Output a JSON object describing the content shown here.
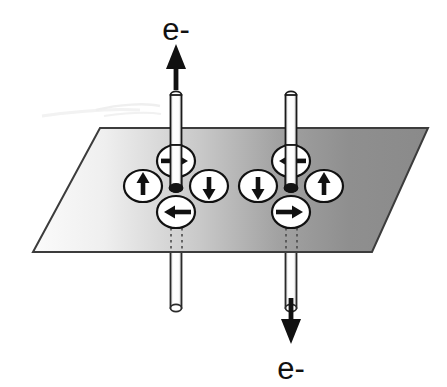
{
  "figure": {
    "width": 447,
    "height": 387,
    "background_color": "#ffffff"
  },
  "labels": {
    "top_current": "e-",
    "bottom_current": "e-"
  },
  "plane": {
    "name": "magnetic-layer-plane",
    "shape": "parallelogram",
    "corners": [
      [
        100,
        128
      ],
      [
        428,
        128
      ],
      [
        372,
        252
      ],
      [
        33,
        252
      ]
    ],
    "fill_left_color": "#f2f2f2",
    "fill_right_color": "#8d8d8d",
    "stroke_color": "#3c3c3c",
    "stroke_width": 2
  },
  "electrodes": [
    {
      "name": "left-electrode",
      "position": "left",
      "x": 176,
      "top_y": 92,
      "bottom_y": 310,
      "plane_y": 188,
      "width": 11,
      "body_color": "#ffffff",
      "stroke_color": "#1a1a1a",
      "current_direction": "up",
      "current_label": "e-"
    },
    {
      "name": "right-electrode",
      "position": "right",
      "x": 291,
      "top_y": 92,
      "bottom_y": 310,
      "plane_y": 188,
      "width": 11,
      "body_color": "#ffffff",
      "stroke_color": "#1a1a1a",
      "current_direction": "down",
      "current_label": "e-"
    }
  ],
  "current_arrows": [
    {
      "name": "top-electron-arrow",
      "direction": "up",
      "x": 176,
      "from_y": 88,
      "to_y": 48,
      "color": "#111111"
    },
    {
      "name": "bottom-electron-arrow",
      "direction": "down",
      "x": 291,
      "from_y": 298,
      "to_y": 340,
      "color": "#111111"
    }
  ],
  "spin_clusters": [
    {
      "name": "left-spin-vortex",
      "center": [
        176,
        186
      ],
      "rotation": "counterclockwise",
      "spins": [
        {
          "name": "spin-top",
          "cx": 176,
          "cy": 161,
          "arrow": "right",
          "glyph": "→"
        },
        {
          "name": "spin-left",
          "cx": 143,
          "cy": 186,
          "arrow": "up",
          "glyph": "↑"
        },
        {
          "name": "spin-right",
          "cx": 209,
          "cy": 186,
          "arrow": "down",
          "glyph": "↓"
        },
        {
          "name": "spin-bottom",
          "cx": 176,
          "cy": 212,
          "arrow": "left",
          "glyph": "←"
        }
      ]
    },
    {
      "name": "right-spin-vortex",
      "center": [
        291,
        186
      ],
      "rotation": "clockwise",
      "spins": [
        {
          "name": "spin-top",
          "cx": 291,
          "cy": 161,
          "arrow": "left",
          "glyph": "←"
        },
        {
          "name": "spin-left",
          "cx": 258,
          "cy": 186,
          "arrow": "down",
          "glyph": "↓"
        },
        {
          "name": "spin-right",
          "cx": 324,
          "cy": 186,
          "arrow": "up",
          "glyph": "↑"
        },
        {
          "name": "spin-bottom",
          "cx": 291,
          "cy": 212,
          "arrow": "right",
          "glyph": "→"
        }
      ]
    }
  ],
  "spin_marker_style": {
    "rx": 19,
    "ry": 16,
    "fill": "#ffffff",
    "stroke": "#111111",
    "stroke_width": 2.2,
    "arrow_color": "#111111"
  },
  "dashed_guides": [
    {
      "name": "left-guide-a",
      "x": 171,
      "from_y": 224,
      "to_y": 252
    },
    {
      "name": "left-guide-b",
      "x": 182,
      "from_y": 224,
      "to_y": 252
    },
    {
      "name": "right-guide-a",
      "x": 286,
      "from_y": 224,
      "to_y": 252
    },
    {
      "name": "right-guide-b",
      "x": 297,
      "from_y": 224,
      "to_y": 252
    }
  ],
  "artifact": {
    "name": "scan-artifact",
    "color": "#ebebeb"
  }
}
